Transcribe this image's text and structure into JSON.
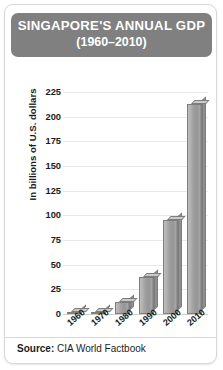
{
  "title": {
    "main": "SINGAPORE'S ANNUAL GDP",
    "subtitle": "(1960–2010)",
    "banner_color": "#808080",
    "text_color": "#ffffff"
  },
  "source": {
    "label": "Source:",
    "value": "CIA World Factbook"
  },
  "chart_data": {
    "type": "bar",
    "title": "SINGAPORE'S ANNUAL GDP (1960–2010)",
    "subtitle": "(1960–2010)",
    "xlabel": "",
    "ylabel": "In billions of U.S. dollars",
    "categories": [
      "1960",
      "1970",
      "1980",
      "1990",
      "2000",
      "2010"
    ],
    "values": [
      1,
      2,
      12,
      38,
      95,
      213
    ],
    "ylim": [
      0,
      225
    ],
    "yticks": [
      0,
      25,
      50,
      75,
      100,
      125,
      150,
      175,
      200,
      225
    ],
    "ytick_labels": [
      "0",
      "25",
      "50",
      "75",
      "100",
      "125",
      "150",
      "175",
      "200",
      "225"
    ],
    "grid": true,
    "legend": false,
    "bar_style": "3d",
    "bar_color": "#9d9d9d",
    "bar_top_color": "#cacaca",
    "bar_edge_color": "#7d7d7d",
    "grid_color": "#e9e9e9",
    "xtick_rotation": -40,
    "source": "CIA World Factbook"
  }
}
